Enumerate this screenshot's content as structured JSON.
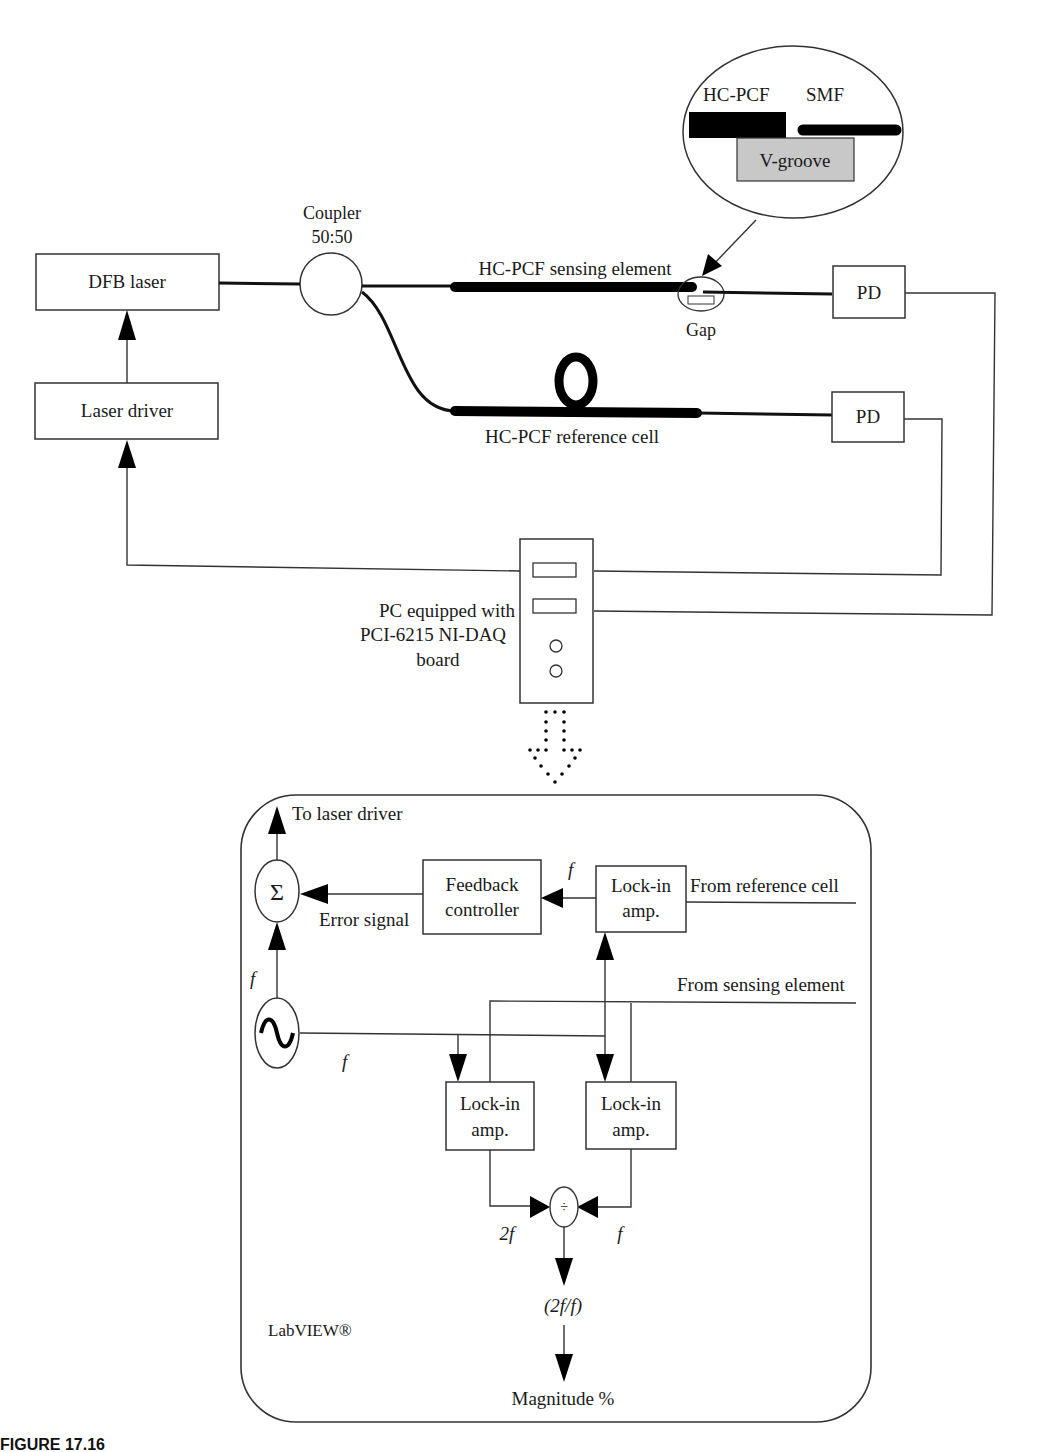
{
  "setup": {
    "inset": {
      "hcpcf_label": "HC-PCF",
      "smf_label": "SMF",
      "vgroove_label": "V-groove"
    },
    "coupler": {
      "line1": "Coupler",
      "line2": "50:50"
    },
    "dfb_laser": "DFB laser",
    "laser_driver": "Laser driver",
    "sensing_element": "HC-PCF sensing element",
    "gap": "Gap",
    "reference_cell": "HC-PCF reference cell",
    "pd_top": "PD",
    "pd_bottom": "PD",
    "pc": {
      "line1": "PC equipped with",
      "line2": "PCI-6215 NI-DAQ",
      "line3": "board"
    }
  },
  "labview": {
    "to_laser_driver": "To laser driver",
    "sigma_symbol": "Σ",
    "sine_symbol": "∿",
    "error_signal": "Error signal",
    "feedback_controller": {
      "line1": "Feedback",
      "line2": "controller"
    },
    "lockin_ref": {
      "line1": "Lock-in",
      "line2": "amp."
    },
    "lockin_left": {
      "line1": "Lock-in",
      "line2": "amp."
    },
    "lockin_right": {
      "line1": "Lock-in",
      "line2": "amp."
    },
    "from_reference_cell": "From reference cell",
    "from_sensing_element": "From sensing element",
    "f_label_sum": "f",
    "f_label_osc": "f",
    "f_label_feedback": "f",
    "f_label_div_right": "f",
    "two_f_label": "2f",
    "divide_symbol": "÷",
    "ratio_label": "(2f/f)",
    "magnitude": "Magnitude %",
    "labview_label": "LabVIEW®"
  },
  "caption": "FIGURE 17.16"
}
